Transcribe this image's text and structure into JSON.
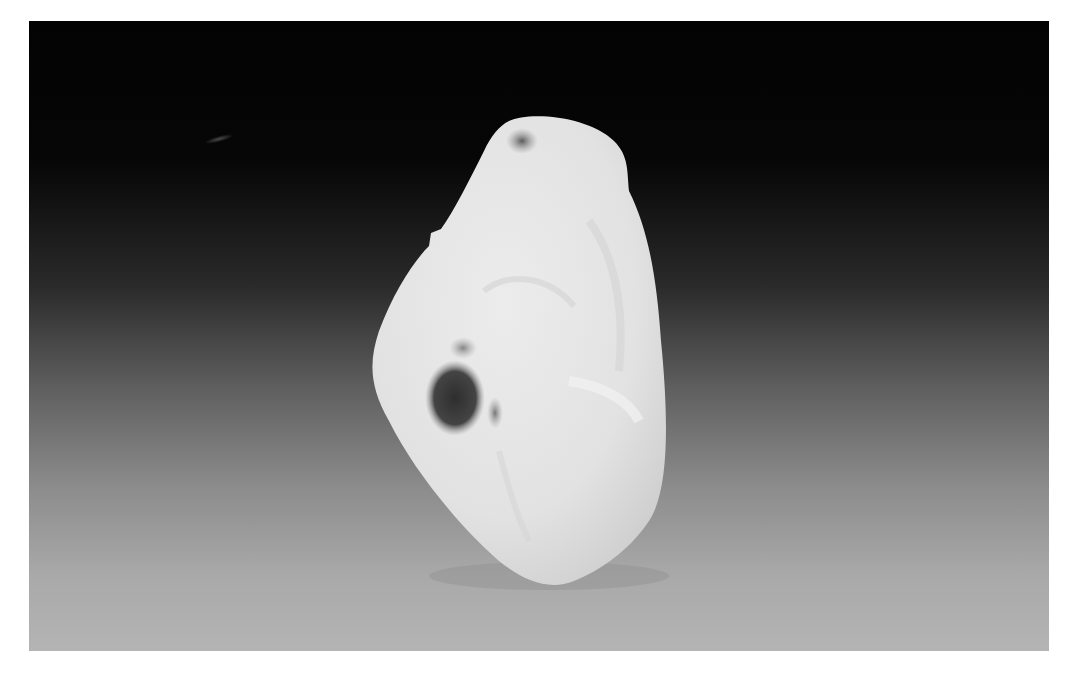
{
  "image": {
    "subject": "white jade carving",
    "background": "black-to-gray gradient backdrop",
    "colors": {
      "frame": "#ffffff",
      "backdrop_top": "#030303",
      "backdrop_bottom": "#b4b4b4",
      "jade_body": "#e6e6e6",
      "jade_shadow": "#cfcfcf",
      "inclusion": "#3a3a3a"
    }
  }
}
